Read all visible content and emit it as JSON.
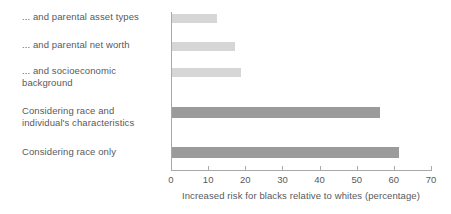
{
  "chart_data": {
    "type": "bar",
    "orientation": "horizontal",
    "title": "",
    "subtitle": "",
    "xlabel": "Increased risk for blacks relative to whites (percentage)",
    "ylabel": "",
    "xlim": [
      0,
      70
    ],
    "xticks": [
      0,
      10,
      20,
      30,
      40,
      50,
      60,
      70
    ],
    "xtick_labels": [
      "0",
      "10",
      "20",
      "30",
      "40",
      "50",
      "60",
      "70"
    ],
    "grid": false,
    "legend": false,
    "legend_position": "none",
    "categories": [
      "... and parental asset types",
      "... and parental net worth",
      "... and socioeconomic\nbackground",
      "Considering race and\nindividual's characteristics",
      "Considering race only"
    ],
    "values": [
      12,
      17,
      18.5,
      56,
      61
    ],
    "series": [
      {
        "name": "Increased risk for blacks relative to whites",
        "values": [
          12,
          17,
          18.5,
          56,
          61
        ]
      }
    ],
    "bar_colors": [
      "#d6d6d6",
      "#d6d6d6",
      "#d6d6d6",
      "#9b9b9b",
      "#9b9b9b"
    ],
    "colors": {
      "light_bar": "#d6d6d6",
      "dark_bar": "#9b9b9b",
      "axis": "#a9a9a9",
      "text": "#59595b",
      "background": "#ffffff"
    }
  }
}
